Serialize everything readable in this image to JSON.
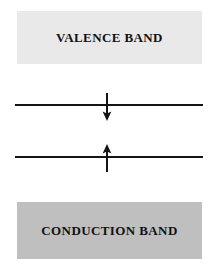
{
  "diagram": {
    "type": "energy-band-spin-diagram",
    "title": "",
    "background_color": "#ffffff",
    "bands": [
      {
        "id": "valence-band",
        "label": "VALENCE BAND",
        "fill_color": "#e9e9e9",
        "position": "top"
      },
      {
        "id": "conduction-band",
        "label": "CONDUCTION BAND",
        "fill_color": "#bfbfbf",
        "position": "bottom"
      }
    ],
    "levels": [
      {
        "id": "level-line-upper",
        "label": "",
        "line_color": "#141414",
        "spin": "down",
        "spin_symbol": "↓"
      },
      {
        "id": "level-line-lower",
        "label": "",
        "line_color": "#141414",
        "spin": "up",
        "spin_symbol": "↑"
      }
    ]
  }
}
